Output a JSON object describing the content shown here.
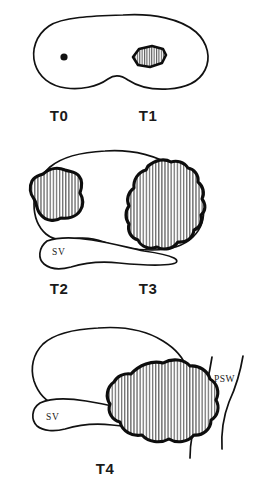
{
  "figure": {
    "background_color": "#ffffff",
    "ink_color": "#111111",
    "hatch_fill": "vertical-line-hatch",
    "panel_count": 3
  },
  "panels": [
    {
      "id": "panel-t0-t1",
      "organ": "prostate-gland-outline",
      "stage_labels": [
        {
          "key": "t0",
          "text": "T0"
        },
        {
          "key": "t1",
          "text": "T1"
        }
      ],
      "features": [
        {
          "key": "t0_focus",
          "name": "microscopic-focus-dot",
          "shape": "solid-dot"
        },
        {
          "key": "t1_nodule",
          "name": "small-hatched-nodule",
          "shape": "hatched-oval"
        }
      ],
      "anatomy_labels": []
    },
    {
      "id": "panel-t2-t3",
      "organ": "prostate-gland-outline",
      "stage_labels": [
        {
          "key": "t2",
          "text": "T2"
        },
        {
          "key": "t3",
          "text": "T3"
        }
      ],
      "features": [
        {
          "key": "t2_mass",
          "name": "intracapsular-hatched-mass",
          "shape": "lobulated-hatched"
        },
        {
          "key": "t3_mass",
          "name": "extracapsular-hatched-mass",
          "shape": "lobulated-hatched"
        }
      ],
      "anatomy_labels": [
        {
          "key": "sv",
          "text": "SV",
          "name": "seminal-vesicle-label"
        }
      ]
    },
    {
      "id": "panel-t4",
      "organ": "prostate-gland-outline",
      "stage_labels": [
        {
          "key": "t4",
          "text": "T4"
        }
      ],
      "features": [
        {
          "key": "t4_mass",
          "name": "pelvic-sidewall-invading-mass",
          "shape": "large-lobulated-hatched"
        }
      ],
      "anatomy_labels": [
        {
          "key": "sv",
          "text": "SV",
          "name": "seminal-vesicle-label"
        },
        {
          "key": "psw",
          "text": "PSW",
          "name": "pelvic-side-wall-label"
        }
      ]
    }
  ],
  "legend_text": {
    "sv_full": "SV",
    "psw_full": "PSW",
    "t0": "T0",
    "t1": "T1",
    "t2": "T2",
    "t3": "T3",
    "t4": "T4"
  }
}
